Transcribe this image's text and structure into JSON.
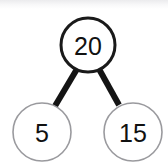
{
  "diagram": {
    "type": "number-bond",
    "background_color": "#ffffff",
    "whole": {
      "value": "20",
      "cx": 88,
      "cy": 45,
      "r": 27,
      "stroke_color": "#1a1a1a",
      "stroke_width": 3,
      "fill_color": "#ffffff",
      "text_color": "#111111",
      "font_size": 25
    },
    "parts": [
      {
        "value": "5",
        "cx": 42,
        "cy": 132,
        "r": 29,
        "stroke_color": "#9a9a9e",
        "stroke_width": 1.6,
        "fill_color": "#ffffff",
        "text_color": "#111111",
        "font_size": 25
      },
      {
        "value": "15",
        "cx": 133,
        "cy": 132,
        "r": 29,
        "stroke_color": "#9a9a9e",
        "stroke_width": 1.6,
        "fill_color": "#ffffff",
        "text_color": "#111111",
        "font_size": 25
      }
    ],
    "connectors": [
      {
        "name": "left",
        "x1": 77,
        "y1": 69,
        "x2": 55,
        "y2": 106,
        "color": "#141414",
        "width": 6
      },
      {
        "name": "right",
        "x1": 99,
        "y1": 69,
        "x2": 119,
        "y2": 105,
        "color": "#141414",
        "width": 6
      }
    ]
  }
}
